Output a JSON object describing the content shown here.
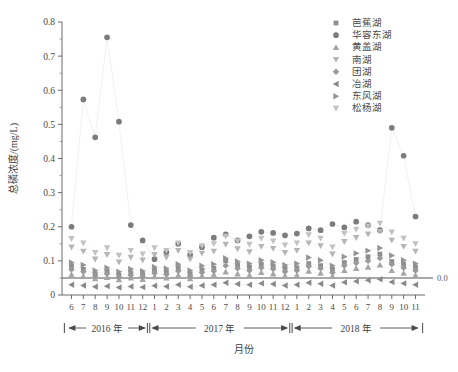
{
  "chart_data": {
    "type": "scatter",
    "title": "",
    "xlabel": "月份",
    "ylabel": "总磷浓度/(mg/L)",
    "ylim": [
      0,
      0.8
    ],
    "ytick_labels": [
      "0",
      "0.1",
      "0.2",
      "0.3",
      "0.4",
      "0.5",
      "0.6",
      "0.7",
      "0.8"
    ],
    "ytick_values": [
      0,
      0.1,
      0.2,
      0.3,
      0.4,
      0.5,
      0.6,
      0.7,
      0.8
    ],
    "grid": false,
    "legend_position": "top-right",
    "x": [
      "6",
      "7",
      "8",
      "9",
      "10",
      "11",
      "12",
      "1",
      "2",
      "3",
      "4",
      "5",
      "6",
      "7",
      "8",
      "9",
      "10",
      "11",
      "12",
      "1",
      "2",
      "3",
      "4",
      "5",
      "6",
      "7",
      "8",
      "9",
      "10",
      "11"
    ],
    "year_groups": [
      {
        "label": "2016 年",
        "start_index": 0,
        "end_index": 6
      },
      {
        "label": "2017 年",
        "start_index": 7,
        "end_index": 18
      },
      {
        "label": "2018 年",
        "start_index": 19,
        "end_index": 29
      }
    ],
    "threshold_line": {
      "value": 0.05,
      "label": "0.0",
      "style": "solid"
    },
    "series": [
      {
        "name": "芭蕉湖",
        "marker": "square",
        "color": "#8d8d8d",
        "values": [
          0.085,
          0.075,
          0.062,
          0.07,
          0.058,
          0.065,
          0.06,
          0.072,
          0.068,
          0.08,
          0.062,
          0.074,
          0.078,
          0.1,
          0.088,
          0.082,
          0.09,
          0.085,
          0.078,
          0.08,
          0.092,
          0.086,
          0.075,
          0.095,
          0.104,
          0.112,
          0.12,
          0.098,
          0.09,
          0.082
        ]
      },
      {
        "name": "华容东湖",
        "marker": "circle",
        "color": "#7c7c7c",
        "values": [
          0.2,
          0.573,
          0.462,
          0.755,
          0.508,
          0.205,
          0.16,
          0.105,
          0.125,
          0.15,
          0.118,
          0.14,
          0.168,
          0.178,
          0.16,
          0.172,
          0.185,
          0.182,
          0.175,
          0.18,
          0.195,
          0.19,
          0.208,
          0.198,
          0.215,
          0.205,
          0.19,
          0.49,
          0.408,
          0.23
        ]
      },
      {
        "name": "黄盖湖",
        "marker": "triangle-up",
        "color": "#a6a6a6",
        "values": [
          0.06,
          0.055,
          0.048,
          0.052,
          0.045,
          0.05,
          0.046,
          0.054,
          0.05,
          0.058,
          0.048,
          0.056,
          0.06,
          0.068,
          0.062,
          0.058,
          0.066,
          0.062,
          0.056,
          0.058,
          0.07,
          0.064,
          0.055,
          0.072,
          0.078,
          0.082,
          0.088,
          0.072,
          0.064,
          0.058
        ]
      },
      {
        "name": "南湖",
        "marker": "triangle-down",
        "color": "#b5b5b5",
        "values": [
          0.14,
          0.128,
          0.105,
          0.118,
          0.096,
          0.11,
          0.102,
          0.118,
          0.11,
          0.13,
          0.105,
          0.122,
          0.128,
          0.148,
          0.135,
          0.126,
          0.142,
          0.136,
          0.124,
          0.13,
          0.152,
          0.144,
          0.12,
          0.156,
          0.168,
          0.178,
          0.186,
          0.16,
          0.142,
          0.128
        ]
      },
      {
        "name": "团湖",
        "marker": "diamond",
        "color": "#999999",
        "values": [
          0.075,
          0.068,
          0.056,
          0.062,
          0.052,
          0.058,
          0.054,
          0.064,
          0.06,
          0.07,
          0.056,
          0.066,
          0.07,
          0.086,
          0.078,
          0.072,
          0.08,
          0.076,
          0.068,
          0.072,
          0.084,
          0.078,
          0.066,
          0.086,
          0.094,
          0.1,
          0.108,
          0.09,
          0.08,
          0.072
        ]
      },
      {
        "name": "冶湖",
        "marker": "triangle-left",
        "color": "#8a8a8a",
        "values": [
          0.03,
          0.028,
          0.024,
          0.026,
          0.022,
          0.025,
          0.023,
          0.027,
          0.025,
          0.03,
          0.024,
          0.028,
          0.03,
          0.036,
          0.032,
          0.03,
          0.034,
          0.032,
          0.028,
          0.03,
          0.036,
          0.033,
          0.028,
          0.037,
          0.04,
          0.043,
          0.046,
          0.038,
          0.034,
          0.03
        ]
      },
      {
        "name": "东风湖",
        "marker": "triangle-right",
        "color": "#949494",
        "values": [
          0.095,
          0.088,
          0.072,
          0.08,
          0.068,
          0.076,
          0.07,
          0.082,
          0.078,
          0.09,
          0.072,
          0.086,
          0.09,
          0.108,
          0.098,
          0.092,
          0.102,
          0.096,
          0.088,
          0.092,
          0.11,
          0.102,
          0.086,
          0.112,
          0.122,
          0.13,
          0.138,
          0.116,
          0.102,
          0.092
        ]
      },
      {
        "name": "松杨湖",
        "marker": "triangle-down",
        "color": "#c2c2c2",
        "values": [
          0.165,
          0.152,
          0.124,
          0.138,
          0.116,
          0.13,
          0.12,
          0.138,
          0.13,
          0.152,
          0.124,
          0.144,
          0.15,
          0.172,
          0.158,
          0.148,
          0.166,
          0.158,
          0.146,
          0.152,
          0.176,
          0.166,
          0.14,
          0.18,
          0.192,
          0.202,
          0.21,
          0.184,
          0.166,
          0.15
        ]
      }
    ]
  },
  "legend": {
    "items": [
      {
        "label": "芭蕉湖",
        "marker": "square-icon"
      },
      {
        "label": "华容东湖",
        "marker": "circle-icon"
      },
      {
        "label": "黄盖湖",
        "marker": "triangle-up-icon"
      },
      {
        "label": "南湖",
        "marker": "triangle-down-icon"
      },
      {
        "label": "团湖",
        "marker": "diamond-icon"
      },
      {
        "label": "冶湖",
        "marker": "triangle-left-icon"
      },
      {
        "label": "东风湖",
        "marker": "triangle-right-icon"
      },
      {
        "label": "松杨湖",
        "marker": "triangle-down-icon"
      }
    ]
  }
}
